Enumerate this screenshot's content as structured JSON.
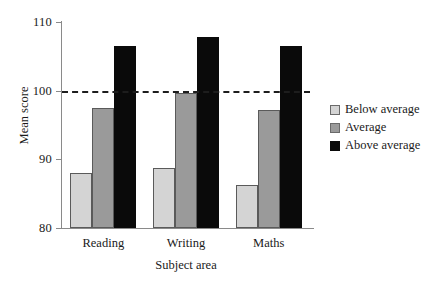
{
  "chart_data": {
    "type": "bar",
    "title": "",
    "xlabel": "Subject area",
    "ylabel": "Mean score",
    "categories": [
      "Reading",
      "Writing",
      "Maths"
    ],
    "series": [
      {
        "name": "Below average",
        "color": "#d4d4d4",
        "values": [
          88.0,
          88.7,
          86.3
        ]
      },
      {
        "name": "Average",
        "color": "#9a9a9a",
        "values": [
          97.5,
          99.7,
          97.2
        ]
      },
      {
        "name": "Above average",
        "color": "#0a0a0a",
        "values": [
          106.5,
          107.8,
          106.5
        ]
      }
    ],
    "ylim": [
      80,
      110
    ],
    "yticks": [
      80,
      90,
      100,
      110
    ],
    "ytick_labels": [
      "80",
      "90",
      "100",
      "110"
    ],
    "grid": false,
    "legend_position": "right",
    "reference_line": {
      "value": 100,
      "style": "dashed",
      "color": "#1d1d1d"
    }
  },
  "legend": {
    "items": [
      {
        "label": "Below average"
      },
      {
        "label": "Average"
      },
      {
        "label": "Above average"
      }
    ]
  }
}
